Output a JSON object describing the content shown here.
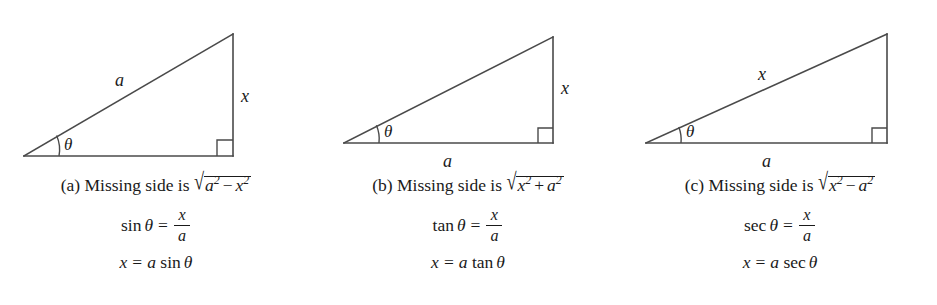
{
  "figure": {
    "background": "#ffffff",
    "stroke_color": "#4a4a4a",
    "text_color": "#1a1a1a"
  },
  "panels": [
    {
      "id": "a",
      "label": "(a)",
      "caption_prefix": "Missing side is",
      "radical": {
        "first_term": "a",
        "first_exp": "2",
        "operator": "−",
        "second_term": "x",
        "second_exp": "2"
      },
      "ratio": {
        "function": "sin",
        "angle": "θ",
        "equals": "=",
        "numerator": "x",
        "denominator": "a"
      },
      "solved": {
        "left": "x",
        "equals": "=",
        "coefficient": "a",
        "function": "sin",
        "angle": "θ"
      },
      "triangle": {
        "hypotenuse_label": "a",
        "vertical_label": "x",
        "base_label": "",
        "angle_label": "θ",
        "base_label_position": "none"
      }
    },
    {
      "id": "b",
      "label": "(b)",
      "caption_prefix": "Missing side is",
      "radical": {
        "first_term": "x",
        "first_exp": "2",
        "operator": "+",
        "second_term": "a",
        "second_exp": "2"
      },
      "ratio": {
        "function": "tan",
        "angle": "θ",
        "equals": "=",
        "numerator": "x",
        "denominator": "a"
      },
      "solved": {
        "left": "x",
        "equals": "=",
        "coefficient": "a",
        "function": "tan",
        "angle": "θ"
      },
      "triangle": {
        "hypotenuse_label": "",
        "vertical_label": "x",
        "base_label": "a",
        "angle_label": "θ",
        "base_label_position": "below"
      }
    },
    {
      "id": "c",
      "label": "(c)",
      "caption_prefix": "Missing side is",
      "radical": {
        "first_term": "x",
        "first_exp": "2",
        "operator": "−",
        "second_term": "a",
        "second_exp": "2"
      },
      "ratio": {
        "function": "sec",
        "angle": "θ",
        "equals": "=",
        "numerator": "x",
        "denominator": "a"
      },
      "solved": {
        "left": "x",
        "equals": "=",
        "coefficient": "a",
        "function": "sec",
        "angle": "θ"
      },
      "triangle": {
        "hypotenuse_label": "x",
        "vertical_label": "",
        "base_label": "a",
        "angle_label": "θ",
        "base_label_position": "below"
      }
    }
  ],
  "symbols": {
    "radical_sign": "√"
  }
}
